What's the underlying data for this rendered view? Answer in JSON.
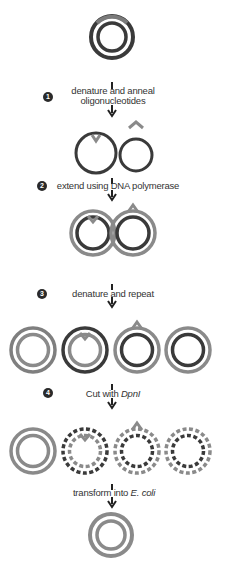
{
  "colors": {
    "dark": "#3a3a3a",
    "grey": "#8a8a8a",
    "white": "#ffffff"
  },
  "steps": [
    {
      "number": "1",
      "label_lines": [
        "denature and anneal",
        "oligonucleotides"
      ]
    },
    {
      "number": "2",
      "label": "extend using DNA polymerase"
    },
    {
      "number": "3",
      "label": "denature and repeat"
    },
    {
      "number": "4",
      "label_prefix": "Cut with ",
      "label_italic": "DpnI"
    },
    {
      "number": "",
      "label_prefix": "transform into ",
      "label_italic": "E. coli"
    }
  ],
  "stages": [
    {
      "name": "template-plasmid",
      "count": 1
    },
    {
      "name": "annealed-strands",
      "count": 2
    },
    {
      "name": "extended-plasmids",
      "count": 2
    },
    {
      "name": "amplified-plasmids",
      "count": 4
    },
    {
      "name": "dpni-digested-plasmids",
      "count": 4
    },
    {
      "name": "transformed-plasmid",
      "count": 1
    }
  ]
}
